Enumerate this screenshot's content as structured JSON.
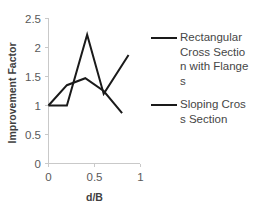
{
  "chart_data": {
    "type": "line",
    "title": "",
    "xlabel": "d/B",
    "ylabel": "Improvement Factor",
    "xlim": [
      0,
      1
    ],
    "ylim": [
      0,
      2.5
    ],
    "xticks": [
      "0",
      "0.5",
      "1"
    ],
    "xtick_values": [
      0,
      0.5,
      1
    ],
    "yticks": [
      "0",
      "0.5",
      "1",
      "1.5",
      "2",
      "2.5"
    ],
    "ytick_values": [
      0,
      0.5,
      1,
      1.5,
      2,
      2.5
    ],
    "grid": false,
    "legend_position": "right",
    "series": [
      {
        "name": "Rectangular Cross Section with Flanges",
        "color": "#1a1a1a",
        "x": [
          0.0,
          0.2,
          0.42,
          0.6,
          0.87
        ],
        "values": [
          1.0,
          1.0,
          2.22,
          1.2,
          1.87
        ]
      },
      {
        "name": "Sloping Cross Section",
        "color": "#1a1a1a",
        "x": [
          0.0,
          0.2,
          0.4,
          0.6,
          0.8
        ],
        "values": [
          1.0,
          1.35,
          1.47,
          1.25,
          0.87
        ]
      }
    ]
  },
  "legend": {
    "entries": [
      {
        "label": "Rectangular Cross Section with Flanges"
      },
      {
        "label": "Sloping Cross Section"
      }
    ]
  },
  "axes": {
    "x_title": "d/B",
    "y_title": "Improvement Factor"
  }
}
